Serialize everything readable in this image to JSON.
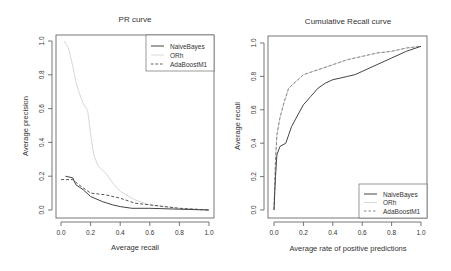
{
  "chart_data": [
    {
      "type": "line",
      "title": "PR curve",
      "xlabel": "Average recall",
      "ylabel": "Average precision",
      "xlim": [
        0,
        1
      ],
      "ylim": [
        0,
        1
      ],
      "xticks": [
        "0.0",
        "0.2",
        "0.4",
        "0.6",
        "0.8",
        "1.0"
      ],
      "yticks": [
        "0.0",
        "0.2",
        "0.4",
        "0.6",
        "0.8",
        "1.0"
      ],
      "grid": false,
      "legend_position": "topright",
      "legend": [
        "NaiveBayes",
        "ORh",
        "AdaBoostM1"
      ],
      "series": [
        {
          "name": "NaiveBayes",
          "style": "solid",
          "color": "#444444",
          "x": [
            0.03,
            0.08,
            0.1,
            0.15,
            0.2,
            0.28,
            0.35,
            0.4,
            0.48,
            0.6,
            0.8,
            1.0
          ],
          "y": [
            0.2,
            0.19,
            0.15,
            0.12,
            0.08,
            0.05,
            0.03,
            0.02,
            0.01,
            0.01,
            0.005,
            0.0
          ]
        },
        {
          "name": "ORh",
          "style": "solid",
          "color": "#d8d8d8",
          "x": [
            0.02,
            0.05,
            0.08,
            0.1,
            0.12,
            0.15,
            0.18,
            0.2,
            0.22,
            0.25,
            0.3,
            0.35,
            0.4,
            0.5,
            0.6,
            0.8,
            1.0
          ],
          "y": [
            1.0,
            0.96,
            0.85,
            0.76,
            0.7,
            0.63,
            0.59,
            0.45,
            0.33,
            0.26,
            0.22,
            0.16,
            0.11,
            0.06,
            0.03,
            0.01,
            0.0
          ]
        },
        {
          "name": "AdaBoostM1",
          "style": "dashed",
          "color": "#555555",
          "x": [
            0.0,
            0.08,
            0.12,
            0.2,
            0.3,
            0.4,
            0.5,
            0.6,
            0.8,
            1.0
          ],
          "y": [
            0.18,
            0.18,
            0.15,
            0.1,
            0.09,
            0.07,
            0.04,
            0.03,
            0.01,
            0.0
          ]
        }
      ]
    },
    {
      "type": "line",
      "title": "Cumulative Recall curve",
      "xlabel": "Average rate of positive predictions",
      "ylabel": "Average recall",
      "xlim": [
        0,
        1
      ],
      "ylim": [
        0,
        1
      ],
      "xticks": [
        "0.0",
        "0.2",
        "0.4",
        "0.6",
        "0.8",
        "1.0"
      ],
      "yticks": [
        "0.0",
        "0.2",
        "0.4",
        "0.6",
        "0.8",
        "1.0"
      ],
      "grid": false,
      "legend_position": "bottomright",
      "legend": [
        "NaiveBayes",
        "ORh",
        "AdaBoostM1"
      ],
      "series": [
        {
          "name": "NaiveBayes",
          "style": "solid",
          "color": "#444444",
          "x": [
            0.0,
            0.01,
            0.02,
            0.04,
            0.08,
            0.1,
            0.12,
            0.15,
            0.2,
            0.25,
            0.3,
            0.35,
            0.4,
            0.45,
            0.5,
            0.55,
            0.6,
            0.7,
            0.8,
            0.9,
            1.0
          ],
          "y": [
            0.0,
            0.2,
            0.33,
            0.38,
            0.4,
            0.45,
            0.5,
            0.55,
            0.63,
            0.68,
            0.73,
            0.76,
            0.78,
            0.79,
            0.8,
            0.81,
            0.83,
            0.87,
            0.91,
            0.95,
            0.98
          ]
        },
        {
          "name": "ORh",
          "style": "solid",
          "color": "#d8d8d8",
          "x": [
            0.0,
            0.01,
            0.02,
            0.04,
            0.07,
            0.1,
            0.15,
            0.2,
            0.3,
            0.4,
            0.5,
            0.6,
            0.7,
            0.8,
            0.9,
            1.0
          ],
          "y": [
            0.0,
            0.3,
            0.45,
            0.55,
            0.65,
            0.73,
            0.77,
            0.81,
            0.84,
            0.87,
            0.9,
            0.92,
            0.94,
            0.95,
            0.97,
            0.98
          ]
        },
        {
          "name": "AdaBoostM1",
          "style": "dashed",
          "color": "#555555",
          "x": [
            0.0,
            0.01,
            0.02,
            0.04,
            0.07,
            0.1,
            0.15,
            0.2,
            0.3,
            0.4,
            0.5,
            0.6,
            0.7,
            0.8,
            0.9,
            1.0
          ],
          "y": [
            0.0,
            0.3,
            0.45,
            0.55,
            0.65,
            0.73,
            0.77,
            0.81,
            0.84,
            0.87,
            0.9,
            0.92,
            0.94,
            0.95,
            0.97,
            0.98
          ]
        }
      ]
    }
  ]
}
